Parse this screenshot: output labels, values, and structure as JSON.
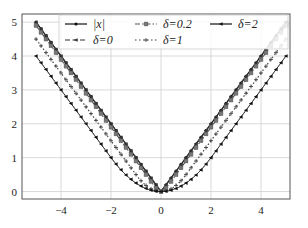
{
  "chart_data": {
    "type": "line",
    "title": "",
    "xlabel": "",
    "ylabel": "",
    "xlim": [
      -5.56,
      5.16
    ],
    "ylim": [
      -0.22,
      5.24
    ],
    "grid": true,
    "legend_position": "upper center",
    "x_ticks": [
      -4,
      -2,
      0,
      2,
      4
    ],
    "x_tick_labels": [
      "−4",
      "−2",
      "0",
      "2",
      "4"
    ],
    "y_ticks": [
      0,
      1,
      2,
      3,
      4,
      5
    ],
    "y_tick_labels": [
      "0",
      "1",
      "2",
      "3",
      "4",
      "5"
    ],
    "x_domain": [
      -5,
      5
    ],
    "series": [
      {
        "name": "|x|",
        "label": "|x|",
        "delta": null,
        "style": "solid",
        "marker": "circle",
        "color": "#111111",
        "x": [
          -5,
          -4,
          -3,
          -2,
          -1,
          0,
          1,
          2,
          3,
          4,
          5
        ],
        "values": [
          5,
          4,
          3,
          2,
          1,
          0,
          1,
          2,
          3,
          4,
          5
        ]
      },
      {
        "name": "delta=0",
        "label": "δ=0",
        "delta": 0,
        "style": "dashed",
        "marker": "tri-left",
        "color": "#333333",
        "x": [
          -5,
          -4,
          -3,
          -2,
          -1,
          0,
          1,
          2,
          3,
          4,
          5
        ],
        "values": [
          5,
          4,
          3,
          2,
          1,
          0,
          1,
          2,
          3,
          4,
          5
        ]
      },
      {
        "name": "delta=0.2",
        "label": "δ=0.2",
        "delta": 0.2,
        "style": "dashdot",
        "marker": "square",
        "color": "#555555",
        "x": [
          -5,
          -4,
          -3,
          -2,
          -1,
          0,
          1,
          2,
          3,
          4,
          5
        ],
        "values": [
          4.9,
          3.9,
          2.9,
          1.9,
          0.9,
          0,
          0.9,
          1.9,
          2.9,
          3.9,
          4.9
        ]
      },
      {
        "name": "delta=1",
        "label": "δ=1",
        "delta": 1,
        "style": "dotted",
        "marker": "plus",
        "color": "#444444",
        "x": [
          -5,
          -4,
          -3,
          -2,
          -1,
          0,
          1,
          2,
          3,
          4,
          5
        ],
        "values": [
          4.5,
          3.5,
          2.5,
          1.5,
          0.5,
          0,
          0.5,
          1.5,
          2.5,
          3.5,
          4.5
        ]
      },
      {
        "name": "delta=2",
        "label": "δ=2",
        "delta": 2,
        "style": "solid-thin",
        "marker": "tri-left",
        "color": "#111111",
        "x": [
          -5,
          -4,
          -3,
          -2,
          -1,
          0,
          1,
          2,
          3,
          4,
          5
        ],
        "values": [
          4,
          3,
          2,
          1,
          0.25,
          0,
          0.25,
          1,
          2,
          3,
          4
        ]
      }
    ],
    "formula_note": "Huber-type smoothing: x^2/(2δ) for |x|≤δ, |x|−δ/2 otherwise"
  },
  "legend": {
    "items": [
      {
        "label": "|x|"
      },
      {
        "label": "δ=0"
      },
      {
        "label": "δ=0.2"
      },
      {
        "label": "δ=1"
      },
      {
        "label": "δ=2"
      }
    ]
  }
}
